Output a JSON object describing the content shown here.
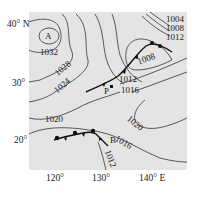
{
  "map": {
    "type": "isobar-weather-map",
    "unit": "hPa",
    "background_color": "#e6e6e6",
    "axes": {
      "latitude_labels": [
        "40° N",
        "30°",
        "20°"
      ],
      "longitude_labels": [
        "120°",
        "130°",
        "140° E"
      ]
    },
    "pressure_centers": [
      {
        "label": "A",
        "type": "high"
      }
    ],
    "points": [
      {
        "label": "P"
      },
      {
        "label": "B"
      }
    ],
    "isobar_labels": [
      "1032",
      "1028",
      "1024",
      "1020",
      "1020",
      "1016",
      "1016",
      "1012",
      "1012",
      "1008",
      "1004",
      "1008",
      "1012"
    ],
    "fronts": [
      {
        "name": "cold-front-north",
        "type": "cold"
      },
      {
        "name": "stationary-front-south",
        "type": "stationary"
      }
    ]
  }
}
